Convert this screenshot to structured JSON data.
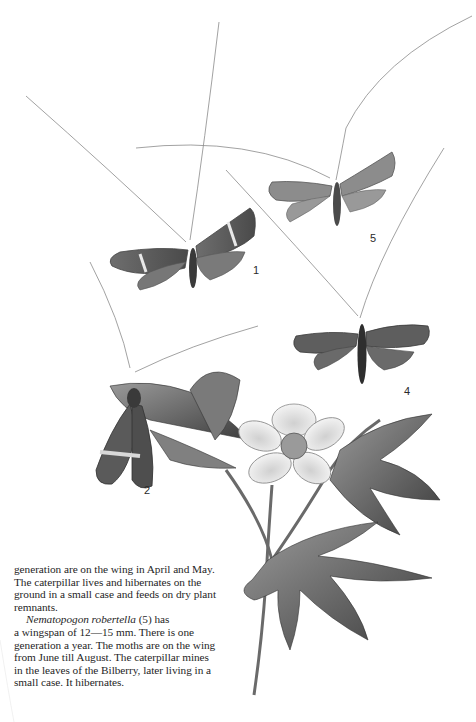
{
  "illustration": {
    "description": "Plate of moths with long antennae and a wood anemone plant",
    "figure_labels": [
      {
        "id": "1",
        "label": "1"
      },
      {
        "id": "5",
        "label": "5"
      },
      {
        "id": "4",
        "label": "4"
      },
      {
        "id": "2",
        "label": "2"
      }
    ]
  },
  "text": {
    "paragraph1": "generation are on the wing in April and May. The caterpillar lives and hibernates on the ground in a small case and feeds on dry plant remnants.",
    "paragraph2_species": "Nematopogon robertella",
    "paragraph2_ref": " (5) has",
    "paragraph2_rest": "a wingspan of 12—15 mm. There is one generation a year. The moths are on the wing from June till August. The caterpillar mines in the leaves of the Bilberry, later living in a small case. It hibernates."
  }
}
